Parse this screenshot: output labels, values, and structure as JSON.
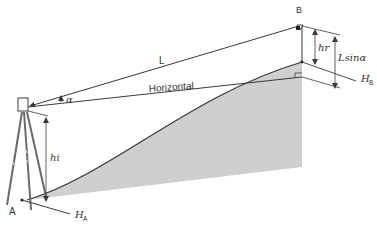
{
  "diagram": {
    "labels": {
      "point_a": "A",
      "point_b": "B",
      "slope_distance": "L",
      "horizontal": "Horizontal",
      "angle": "α",
      "instrument_height": "hi",
      "target_height": "hr",
      "vertical_component": "Lsinα",
      "height_a_main": "H",
      "height_a_sub": "A",
      "height_b_main": "H",
      "height_b_sub": "B"
    },
    "colors": {
      "line": "#3a3a3a",
      "terrain_fill": "#cfcfcf",
      "background": "#ffffff"
    }
  }
}
